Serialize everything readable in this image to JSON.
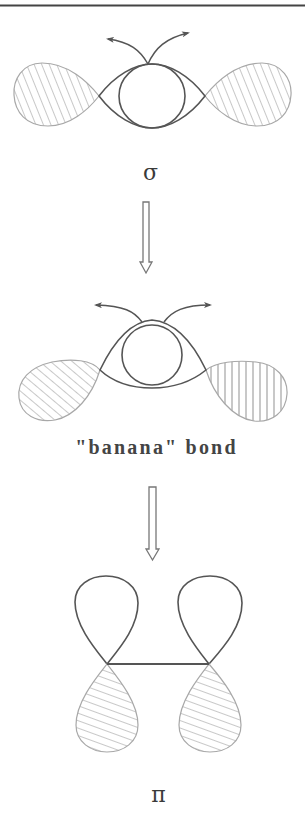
{
  "figure": {
    "colors": {
      "outline": "#555555",
      "lobe_outline": "#a8a8a8",
      "hatch": "#9a9a9a",
      "rule": "#444444",
      "text": "#3a3a3a"
    },
    "stages": [
      {
        "id": "sigma",
        "label": "σ",
        "lobes": [
          {
            "side": "left",
            "hatch": "diagonal-steep"
          },
          {
            "side": "right",
            "hatch": "diagonal-steep"
          }
        ],
        "has_central_ring": true,
        "has_curved_arrows": true
      },
      {
        "id": "banana",
        "label": "\"banana\" bond",
        "lobes": [
          {
            "side": "left",
            "hatch": "diagonal"
          },
          {
            "side": "right",
            "hatch": "vertical"
          }
        ],
        "has_central_ring": true,
        "has_curved_arrows": true
      },
      {
        "id": "pi",
        "label": "π",
        "lobes": [
          {
            "position": "upper-left",
            "hatch": "none"
          },
          {
            "position": "upper-right",
            "hatch": "none"
          },
          {
            "position": "lower-left",
            "hatch": "shallow-diagonal"
          },
          {
            "position": "lower-right",
            "hatch": "shallow-diagonal"
          }
        ],
        "has_bond_line": true
      }
    ],
    "transition_arrows": [
      {
        "from": "sigma",
        "to": "banana",
        "style": "hollow-down-arrow"
      },
      {
        "from": "banana",
        "to": "pi",
        "style": "hollow-down-arrow"
      }
    ]
  }
}
